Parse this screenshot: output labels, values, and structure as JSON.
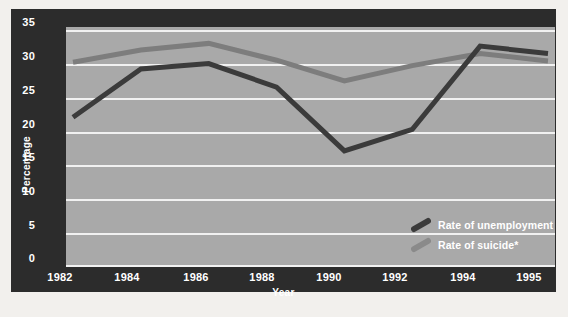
{
  "chart_data": {
    "type": "line",
    "title": "",
    "xlabel": "Year",
    "ylabel": "Percentage",
    "categories": [
      "1982",
      "1984",
      "1986",
      "1988",
      "1990",
      "1992",
      "1994",
      "1995"
    ],
    "ylim": [
      0,
      35
    ],
    "yticks": [
      "0",
      "5",
      "10",
      "15",
      "20",
      "25",
      "30",
      "35"
    ],
    "grid": true,
    "legend_position": "inside-bottom-right",
    "series": [
      {
        "name": "Rate of unemployment",
        "color": "#3b3b3b",
        "values": [
          22,
          29.2,
          30,
          26.5,
          17,
          20.2,
          32.6,
          31.5
        ]
      },
      {
        "name": "Rate of suicide*",
        "color": "#7d7d7d",
        "values": [
          30.2,
          32,
          33,
          30.5,
          27.4,
          29.7,
          31.5,
          30.4
        ]
      }
    ]
  },
  "axes": {
    "y_label": "Percentage",
    "x_label": "Year",
    "y_ticks": [
      "35",
      "30",
      "25",
      "20",
      "15",
      "10",
      "5",
      "0"
    ],
    "x_ticks": [
      "1982",
      "1984",
      "1986",
      "1988",
      "1990",
      "1992",
      "1994",
      "1995"
    ]
  },
  "legend": {
    "items": [
      {
        "label": "Rate of unemployment",
        "color": "#3b3b3b"
      },
      {
        "label": "Rate of suicide*",
        "color": "#7d7d7d"
      }
    ]
  },
  "colors": {
    "frame": "#2c2c2c",
    "plot_background": "#a9a9a9",
    "gridline": "#f1f1f1",
    "unemployment": "#3b3b3b",
    "suicide": "#7d7d7d",
    "tick_text": "#ffffff"
  }
}
